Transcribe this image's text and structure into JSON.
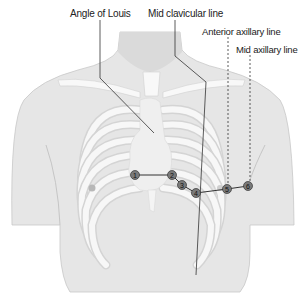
{
  "diagram": {
    "labels": {
      "angle_of_louis": "Angle of Louis",
      "mid_clavicular": "Mid clavicular line",
      "anterior_axillary": "Anterior axillary line",
      "mid_axillary": "Mid axillary line"
    },
    "electrodes": [
      {
        "id": "1",
        "x": 135,
        "y": 175
      },
      {
        "id": "2",
        "x": 172,
        "y": 175
      },
      {
        "id": "3",
        "x": 182,
        "y": 185
      },
      {
        "id": "4",
        "x": 196,
        "y": 193
      },
      {
        "id": "5",
        "x": 227,
        "y": 189
      },
      {
        "id": "6",
        "x": 248,
        "y": 186
      }
    ],
    "colors": {
      "skin": "#e4e4e4",
      "skin_dark": "#cfcfcf",
      "bone": "#f6f6f6",
      "rib_gap": "#d6d6d6",
      "electrode": "#7a7a7a",
      "line": "#333333"
    }
  }
}
